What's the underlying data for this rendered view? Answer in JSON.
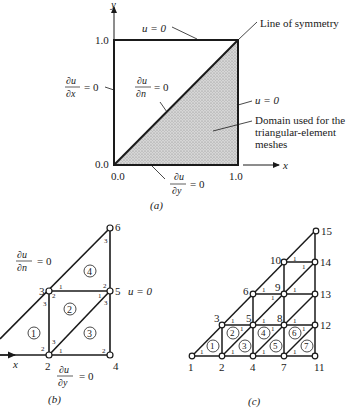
{
  "figure_a": {
    "caption": "(a)",
    "axis_x_label": "x",
    "axis_y_label": "y",
    "tick_y_top": "1.0",
    "tick_y_bottom": "0.0",
    "tick_x_left": "0.0",
    "tick_x_right": "1.0",
    "top_bc": "u = 0",
    "right_bc": "u = 0",
    "left_bc_num": "∂u",
    "left_bc_den": "∂x",
    "left_bc_eq": "= 0",
    "diag_bc_num": "∂u",
    "diag_bc_den": "∂n",
    "diag_bc_eq": "= 0",
    "bottom_bc_num": "∂u",
    "bottom_bc_den": "∂y",
    "bottom_bc_eq": "= 0",
    "symmetry_label": "Line of symmetry",
    "domain_label_1": "Domain used for the",
    "domain_label_2": "triangular-element",
    "domain_label_3": "meshes"
  },
  "figure_b": {
    "caption": "(b)",
    "axis_x_label": "x",
    "diag_bc_num": "∂u",
    "diag_bc_den": "∂n",
    "diag_bc_eq": "= 0",
    "right_bc": "u = 0",
    "bottom_bc_num": "∂u",
    "bottom_bc_den": "∂y",
    "bottom_bc_eq": "= 0",
    "nodes": [
      "2",
      "3",
      "4",
      "5",
      "6"
    ],
    "elements": [
      "1",
      "2",
      "3",
      "4"
    ],
    "local_nodes": [
      "1",
      "2",
      "3"
    ]
  },
  "figure_c": {
    "caption": "(c)",
    "nodes": [
      "1",
      "2",
      "3",
      "4",
      "5",
      "6",
      "7",
      "8",
      "9",
      "10",
      "11",
      "12",
      "13",
      "14",
      "15"
    ],
    "elements": [
      "1",
      "2",
      "3",
      "4",
      "5",
      "6",
      "7"
    ],
    "local_node": "1"
  }
}
